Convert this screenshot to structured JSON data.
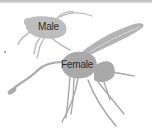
{
  "illustration": {
    "subject": "male and female wasp silhouettes",
    "labels": {
      "male": "Male",
      "female": "Female"
    },
    "colors": {
      "male_fill": "#bdbdbd",
      "female_fill": "#a9a9a9",
      "wing_fill": "#b3b3b3",
      "label_text": "#2b2b2b",
      "background": "#ffffff"
    }
  }
}
